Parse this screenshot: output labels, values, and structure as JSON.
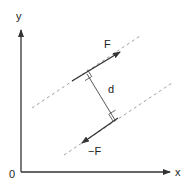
{
  "diagram": {
    "axes": {
      "x_label": "x",
      "y_label": "y",
      "origin_label": "0"
    },
    "forces": [
      {
        "label": "F",
        "direction": "up-right"
      },
      {
        "label": "−F",
        "direction": "down-left"
      }
    ],
    "distance_label": "d",
    "colors": {
      "line": "#333333",
      "dashed": "#888888",
      "background": "#ffffff"
    }
  }
}
